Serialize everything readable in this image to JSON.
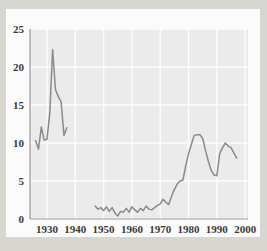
{
  "figure": {
    "colors": {
      "page_border": "#d8d6d0",
      "panel": "#fbfbfb",
      "plot_background": "#ebebeb",
      "gridline": "#fdfdfd",
      "axis": "#9a9a9a",
      "line": "#8a8a8a",
      "tick_text": "#3a3a3a"
    }
  },
  "chart_data": {
    "type": "line",
    "title": "",
    "subtitle": "",
    "xlabel": "",
    "ylabel": "",
    "xlim": [
      1924,
      2001
    ],
    "ylim": [
      0,
      25
    ],
    "xticks": [
      1930,
      1940,
      1950,
      1960,
      1970,
      1980,
      1990,
      2000
    ],
    "xtick_labels": [
      "1930",
      "1940",
      "1950",
      "1960",
      "1970",
      "1980",
      "1990",
      "2000"
    ],
    "yticks": [
      0,
      5,
      10,
      15,
      20,
      25
    ],
    "ytick_labels": [
      "0",
      "5",
      "10",
      "15",
      "20",
      "25"
    ],
    "grid": true,
    "legend": null,
    "annotations": [],
    "series": [
      {
        "name": "segment-1",
        "note": "pre-war segment",
        "x": [
          1926,
          1927,
          1928,
          1929,
          1930,
          1931,
          1932,
          1933,
          1934,
          1935,
          1936,
          1937
        ],
        "values": [
          10.3,
          9.2,
          12.1,
          10.4,
          10.5,
          14.0,
          22.3,
          17.0,
          16.1,
          15.4,
          11.0,
          12.0
        ]
      },
      {
        "name": "segment-2",
        "note": "post-war segment",
        "x": [
          1947,
          1948,
          1949,
          1950,
          1951,
          1952,
          1953,
          1954,
          1955,
          1956,
          1957,
          1958,
          1959,
          1960,
          1961,
          1962,
          1963,
          1964,
          1965,
          1966,
          1967,
          1968,
          1969,
          1970,
          1971,
          1972,
          1973,
          1974,
          1975,
          1976,
          1977,
          1978,
          1979,
          1980,
          1981,
          1982,
          1983,
          1984,
          1985,
          1986,
          1987,
          1988,
          1989,
          1990,
          1991,
          1992,
          1993,
          1994,
          1995,
          1996,
          1997
        ],
        "values": [
          1.7,
          1.3,
          1.5,
          1.1,
          1.6,
          1.0,
          1.5,
          0.8,
          0.4,
          1.0,
          0.9,
          1.4,
          0.9,
          1.6,
          1.2,
          0.9,
          1.4,
          1.1,
          1.7,
          1.3,
          1.2,
          1.5,
          1.8,
          2.0,
          2.6,
          2.2,
          1.9,
          3.0,
          3.9,
          4.6,
          5.0,
          5.1,
          7.0,
          8.6,
          9.8,
          11.0,
          11.1,
          11.1,
          10.6,
          9.0,
          7.6,
          6.4,
          5.8,
          5.7,
          8.6,
          9.4,
          10.0,
          9.6,
          9.4,
          8.7,
          8.0
        ]
      }
    ]
  }
}
